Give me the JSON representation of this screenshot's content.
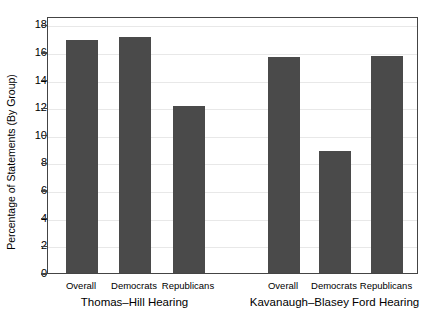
{
  "chart_data": {
    "type": "bar",
    "title": "",
    "xlabel": "",
    "ylabel": "Percentage of Statements (By Group)",
    "ylim": [
      0,
      18.6
    ],
    "yticks": [
      0,
      2,
      4,
      6,
      8,
      10,
      12,
      14,
      16,
      18
    ],
    "ytick_labels": [
      "0",
      "2",
      "4",
      "6",
      "8",
      "10",
      "12",
      "14",
      "16",
      "18"
    ],
    "grid": true,
    "legend": "none",
    "groups": [
      {
        "name": "Thomas–Hill Hearing",
        "categories": [
          "Overall",
          "Democrats",
          "Republicans"
        ],
        "values": [
          16.9,
          17.1,
          12.1
        ]
      },
      {
        "name": "Kavanaugh–Blasey Ford Hearing",
        "categories": [
          "Overall",
          "Democrats",
          "Republicans"
        ],
        "values": [
          15.6,
          8.8,
          15.7
        ]
      }
    ],
    "categories": [
      "Overall",
      "Democrats",
      "Republicans",
      "Overall",
      "Democrats",
      "Republicans"
    ],
    "values": [
      16.9,
      17.1,
      12.1,
      15.6,
      8.8,
      15.7
    ],
    "bar_color": "#4a4a4a"
  },
  "axis": {
    "y_title": "Percentage of Statements (By Group)",
    "ticks": [
      {
        "label": "18",
        "value": 18
      },
      {
        "label": "16",
        "value": 16
      },
      {
        "label": "14",
        "value": 14
      },
      {
        "label": "12",
        "value": 12
      },
      {
        "label": "10",
        "value": 10
      },
      {
        "label": "8",
        "value": 8
      },
      {
        "label": "6",
        "value": 6
      },
      {
        "label": "4",
        "value": 4
      },
      {
        "label": "2",
        "value": 2
      },
      {
        "label": "0",
        "value": 0
      }
    ]
  },
  "x_labels": {
    "bar_1": "Overall",
    "bar_2": "Democrats",
    "bar_3": "Republicans",
    "bar_4": "Overall",
    "bar_5": "Democrats",
    "bar_6": "Republicans",
    "group_1": "Thomas–Hill Hearing",
    "group_2": "Kavanaugh–Blasey Ford Hearing"
  }
}
